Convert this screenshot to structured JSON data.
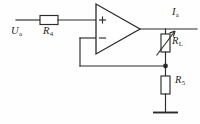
{
  "figure": {
    "kind": "schematic",
    "background_color": "#fefefe",
    "line_color": "#2b2b2b"
  },
  "labels": {
    "input_source": {
      "symbol": "U",
      "subscript": "a"
    },
    "resistor_r4": {
      "symbol": "R",
      "subscript": "4"
    },
    "output_current": {
      "symbol": "I",
      "subscript": "a"
    },
    "resistor_rl": {
      "symbol": "R",
      "subscript": "L"
    },
    "resistor_r5": {
      "symbol": "R",
      "subscript": "5"
    }
  },
  "opamp": {
    "noninverting_input_marker": "+",
    "inverting_input_marker": "−"
  },
  "components": [
    {
      "name": "R4",
      "type": "resistor",
      "orientation": "horizontal"
    },
    {
      "name": "RL",
      "type": "variable-resistor",
      "orientation": "vertical"
    },
    {
      "name": "R5",
      "type": "resistor",
      "orientation": "vertical"
    },
    {
      "name": "GND",
      "type": "ground",
      "orientation": "vertical"
    }
  ]
}
